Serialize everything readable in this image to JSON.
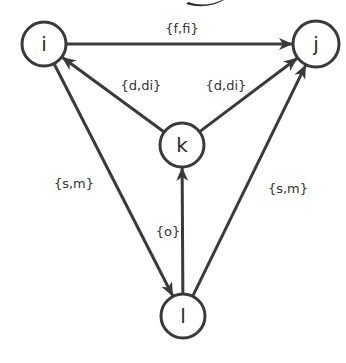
{
  "diagram": {
    "type": "directed-graph",
    "stroke_color": "#3a3a3a",
    "background": "#ffffff",
    "nodes": [
      {
        "id": "i",
        "label": "i",
        "cx": 44,
        "cy": 44,
        "r": 22
      },
      {
        "id": "j",
        "label": "j",
        "cx": 316,
        "cy": 44,
        "r": 23
      },
      {
        "id": "k",
        "label": "k",
        "cx": 182,
        "cy": 145,
        "r": 22
      },
      {
        "id": "l",
        "label": "l",
        "cx": 183,
        "cy": 316,
        "r": 22
      }
    ],
    "edges": [
      {
        "from": "i",
        "to": "j",
        "label": "{f,fi}",
        "label_x": 182,
        "label_y": 33
      },
      {
        "from": "k",
        "to": "i",
        "label": "{d,di}",
        "label_x": 141,
        "label_y": 90
      },
      {
        "from": "k",
        "to": "j",
        "label": "{d,di}",
        "label_x": 226,
        "label_y": 90
      },
      {
        "from": "i",
        "to": "l",
        "label": "{s,m}",
        "label_x": 74,
        "label_y": 188
      },
      {
        "from": "l",
        "to": "k",
        "label": "{o}",
        "label_x": 168,
        "label_y": 236
      },
      {
        "from": "l",
        "to": "j",
        "label": "{s,m}",
        "label_x": 288,
        "label_y": 193
      }
    ]
  }
}
